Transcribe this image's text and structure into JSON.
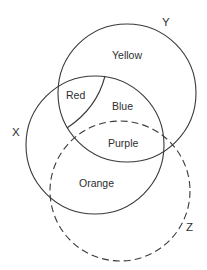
{
  "diagram": {
    "type": "venn",
    "sets": [
      {
        "name": "X",
        "style": "solid"
      },
      {
        "name": "Y",
        "style": "solid"
      },
      {
        "name": "Z",
        "style": "dashed"
      }
    ],
    "set_labels": {
      "x": "X",
      "y": "Y",
      "z": "Z"
    },
    "regions": {
      "yellow": "Yellow",
      "red": "Red",
      "blue": "Blue",
      "purple": "Purple",
      "orange": "Orange"
    },
    "colors": {
      "stroke": "#3a3a3a",
      "text": "#2e2e2e",
      "background": "#ffffff"
    }
  }
}
